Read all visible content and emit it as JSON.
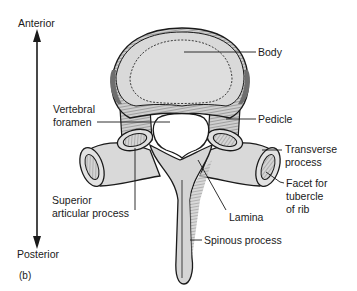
{
  "figure": {
    "panel_label": "(b)",
    "orientation": {
      "top_label": "Anterior",
      "bottom_label": "Posterior"
    },
    "labels": {
      "body": "Body",
      "pedicle": "Pedicle",
      "vertebral_foramen": [
        "Vertebral",
        "foramen"
      ],
      "transverse_process": [
        "Transverse",
        "process"
      ],
      "facet": [
        "Facet for",
        "tubercle",
        "of rib"
      ],
      "superior_articular_process": [
        "Superior",
        "articular process"
      ],
      "lamina": "Lamina",
      "spinous_process": "Spinous process"
    },
    "colors": {
      "bone_fill": "#d9d9d9",
      "bone_dark": "#8a8a8a",
      "outline": "#1a1a1a",
      "background": "#ffffff"
    }
  }
}
